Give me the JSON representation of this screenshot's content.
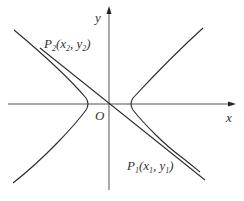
{
  "diagram": {
    "type": "hyperbola-with-line",
    "axes": {
      "x_label": "x",
      "y_label": "y",
      "origin_label": "O"
    },
    "points": [
      {
        "name": "P2",
        "label_main": "P",
        "label_sub": "2",
        "coords_text": "(x",
        "x_sub": "2",
        "sep": ",  y",
        "y_sub": "2",
        "close": ")"
      },
      {
        "name": "P1",
        "label_main": "P",
        "label_sub": "1",
        "coords_text": "(x",
        "x_sub": "1",
        "sep": ",  y",
        "y_sub": "1",
        "close": ")"
      }
    ],
    "colors": {
      "stroke": "#2a2a2a",
      "axis": "#555555",
      "text": "#333333"
    }
  }
}
